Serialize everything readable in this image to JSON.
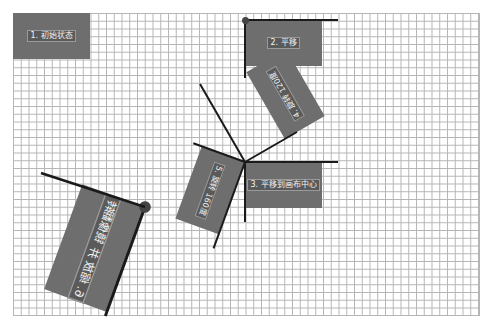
{
  "diagram": {
    "grid": {
      "cell_px": 7.75,
      "line_color": "#b5b5b5"
    },
    "box_color": "#6e6e6e",
    "axis_color": "#1a1a1a",
    "steps": [
      {
        "label": "1. 初始状态"
      },
      {
        "label": "2. 平移"
      },
      {
        "label": "3. 平移到画布中心"
      },
      {
        "label": "4. 旋转 120度"
      },
      {
        "label": "5. 旋转 160度"
      },
      {
        "label": "6. 缩放 并 镜像翻转"
      }
    ]
  }
}
